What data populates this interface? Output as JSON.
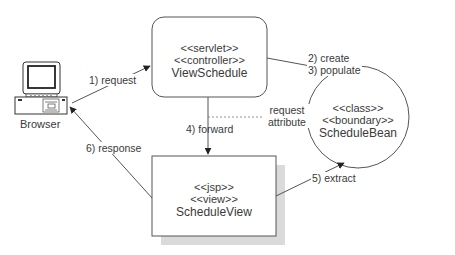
{
  "diagram": {
    "type": "UML collaboration / MVC request flow",
    "nodes": {
      "browser": {
        "label": "Browser",
        "icon": "desktop-computer-icon"
      },
      "controller": {
        "stereotypes": [
          "<<servlet>>",
          "<<controller>>"
        ],
        "name": "ViewSchedule",
        "shape": "rounded-rectangle"
      },
      "view": {
        "stereotypes": [
          "<<jsp>>",
          "<<view>>"
        ],
        "name": "ScheduleView",
        "shape": "rectangle-with-shadow"
      },
      "bean": {
        "stereotypes": [
          "<<class>>",
          "<<boundary>>"
        ],
        "name": "ScheduleBean",
        "shape": "circle"
      }
    },
    "edges": [
      {
        "id": "request",
        "from": "browser",
        "to": "controller",
        "label": "1) request"
      },
      {
        "id": "create-populate",
        "from": "controller",
        "to": "bean",
        "label_lines": [
          "2) create",
          "3) populate"
        ]
      },
      {
        "id": "forward",
        "from": "controller",
        "to": "view",
        "label": "4) forward"
      },
      {
        "id": "request-attribute",
        "from": "forward",
        "to": "bean",
        "style": "dotted",
        "label_lines": [
          "request",
          "attribute"
        ]
      },
      {
        "id": "extract",
        "from": "view",
        "to": "bean",
        "label": "5) extract"
      },
      {
        "id": "response",
        "from": "view",
        "to": "browser",
        "label": "6) response"
      }
    ],
    "colors": {
      "line": "#555555",
      "text": "#3a3a3a",
      "shadow": "#d9d9d9",
      "background": "#ffffff"
    }
  }
}
